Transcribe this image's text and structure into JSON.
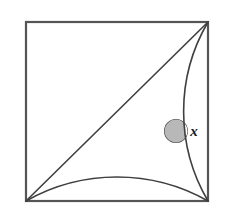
{
  "figure": {
    "background_color": "#ffffff",
    "stroke_color": "#3f3f3f",
    "frame_stroke_color": "#555555",
    "shade_fill_color": "#b8b8b8",
    "shade_stroke_color": "#3f3f3f",
    "square": {
      "left": 26,
      "top": 22,
      "right": 208,
      "bottom": 201,
      "width": 182,
      "height": 179,
      "stroke_width": 2.2
    },
    "corners": {
      "top_left": [
        26,
        22
      ],
      "top_right": [
        208,
        22
      ],
      "bottom_left": [
        26,
        201
      ],
      "bottom_right": [
        208,
        201
      ]
    },
    "curves": [
      {
        "name": "arc-from-bottom-left-over-top",
        "path": "M 26 201 A 182 179 0 0 1 208 201",
        "description": "quarter-style arc sweeping from bottom-left corner up over the middle and down to the bottom-right corner"
      },
      {
        "name": "arc-from-top-right-to-bottom-right",
        "path": "M 208 22 A 182 179 0 0 0 208 201",
        "description": "arc sweeping from top-right corner leftward and down to the bottom-right corner"
      },
      {
        "name": "diagonal-bottom-left-to-top-right",
        "path": "M 26 201 L 208 22",
        "description": "straight diagonal of the square from bottom-left to top-right"
      }
    ],
    "intersection_point": [
      176,
      131
    ],
    "angle_marker": {
      "label": "x",
      "label_position": [
        194,
        131
      ],
      "vertex": [
        176,
        131
      ],
      "radius": 12,
      "fill": "#b8b8b8"
    }
  }
}
